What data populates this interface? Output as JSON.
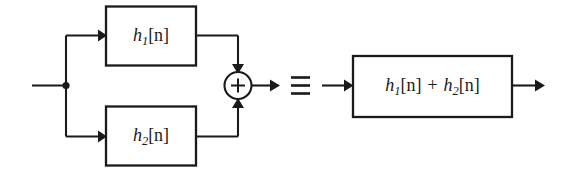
{
  "figure": {
    "type": "block-diagram",
    "background_color": "#ffffff",
    "line_color": "#1a1a1a"
  },
  "left_system": {
    "name": "parallel-connection",
    "input_label": "",
    "output_label": "",
    "blocks": [
      {
        "id": "top",
        "label_h": "h",
        "label_sub": "1",
        "label_arg": "[n]",
        "label_full": "h1[n]"
      },
      {
        "id": "bottom",
        "label_h": "h",
        "label_sub": "2",
        "label_arg": "[n]",
        "label_full": "h2[n]"
      }
    ],
    "adder": {
      "name": "summing-junction",
      "symbol": "+"
    }
  },
  "equivalence": {
    "symbol": "≡",
    "meaning": "is equivalent to"
  },
  "right_system": {
    "name": "combined-system",
    "block": {
      "id": "combined",
      "term1_h": "h",
      "term1_sub": "1",
      "term1_arg": "[n]",
      "operator": "+",
      "term2_h": "h",
      "term2_sub": "2",
      "term2_arg": "[n]",
      "label_full": "h1[n] + h2[n]"
    }
  }
}
